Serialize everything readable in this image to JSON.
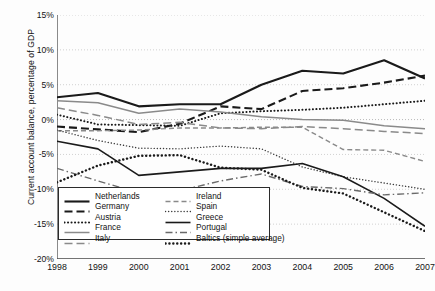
{
  "chart_data": {
    "type": "line",
    "title": "",
    "xlabel": "",
    "ylabel": "Current account balance, percentage of GDP",
    "x": [
      1998,
      1999,
      2000,
      2001,
      2002,
      2003,
      2004,
      2005,
      2006,
      2007
    ],
    "xtick_labels": [
      "1998",
      "1999",
      "2000",
      "2001",
      "2002",
      "2003",
      "2004",
      "2005",
      "2006",
      "2007"
    ],
    "ytick_labels": [
      "15%",
      "10%",
      "5%",
      "0%",
      "-5%",
      "-10%",
      "-15%",
      "-20%"
    ],
    "ytick_values": [
      15,
      10,
      5,
      0,
      -5,
      -10,
      -15,
      -20
    ],
    "ylim": [
      -20,
      15
    ],
    "xlim": [
      1998,
      2007
    ],
    "grid": "horizontal-dotted",
    "legend_position": "bottom-left-inside",
    "series": [
      {
        "name": "Netherlands",
        "style": "solid",
        "color": "#1a1a1a",
        "width": 2.1,
        "values": [
          3.2,
          3.8,
          1.9,
          2.2,
          2.2,
          5.0,
          7.0,
          6.6,
          8.5,
          5.9
        ]
      },
      {
        "name": "Germany",
        "style": "dashed",
        "color": "#1a1a1a",
        "width": 2.1,
        "values": [
          -1.0,
          -1.4,
          -1.8,
          -0.6,
          1.9,
          1.5,
          4.1,
          4.5,
          5.3,
          6.3
        ]
      },
      {
        "name": "Austria",
        "style": "dotted",
        "color": "#1a1a1a",
        "width": 2.0,
        "values": [
          0.7,
          -0.7,
          -0.8,
          -0.9,
          0.9,
          1.2,
          1.4,
          1.7,
          2.2,
          2.7
        ]
      },
      {
        "name": "France",
        "style": "solid",
        "color": "#8a8a8a",
        "width": 1.5,
        "values": [
          2.7,
          2.4,
          0.9,
          1.5,
          1.1,
          0.4,
          0.0,
          -0.1,
          -0.9,
          -1.3
        ]
      },
      {
        "name": "Italy",
        "style": "dashed",
        "color": "#8a8a8a",
        "width": 1.5,
        "values": [
          1.7,
          0.6,
          -0.7,
          -0.4,
          -1.2,
          -1.3,
          -1.0,
          -1.3,
          -1.7,
          -2.0
        ]
      },
      {
        "name": "Ireland",
        "style": "dashed-fine",
        "color": "#8a8a8a",
        "width": 1.4,
        "values": [
          -1.6,
          -1.6,
          -1.5,
          -1.2,
          -1.2,
          -1.1,
          -1.1,
          -4.3,
          -4.4,
          -6.0
        ]
      },
      {
        "name": "Spain",
        "style": "dotted-fine",
        "color": "#3a3a3a",
        "width": 1.4,
        "values": [
          -1.5,
          -3.0,
          -4.1,
          -4.2,
          -3.8,
          -4.2,
          -6.8,
          -8.2,
          -9.1,
          -10.0
        ]
      },
      {
        "name": "Greece",
        "style": "solid",
        "color": "#1a1a1a",
        "width": 1.6,
        "values": [
          -3.1,
          -4.2,
          -8.0,
          -7.5,
          -7.0,
          -7.0,
          -6.3,
          -8.2,
          -11.3,
          -15.3
        ]
      },
      {
        "name": "Portugal",
        "style": "dash-dot",
        "color": "#6a6a6a",
        "width": 1.4,
        "values": [
          -7.0,
          -8.8,
          -10.5,
          -10.2,
          -8.8,
          -7.8,
          -9.6,
          -9.9,
          -10.8,
          -10.5
        ]
      },
      {
        "name": "Baltics (simple average)",
        "style": "dotted-bold",
        "color": "#1a1a1a",
        "width": 2.4,
        "values": [
          -9.0,
          -6.6,
          -5.2,
          -5.1,
          -6.9,
          -7.2,
          -9.8,
          -10.6,
          -13.3,
          -16.0
        ]
      }
    ]
  },
  "legend": {
    "left_column": [
      {
        "label": "Netherlands",
        "style": "solid",
        "color": "#1a1a1a",
        "width": 2.1
      },
      {
        "label": "Germany",
        "style": "dashed",
        "color": "#1a1a1a",
        "width": 2.1
      },
      {
        "label": "Austria",
        "style": "dotted",
        "color": "#1a1a1a",
        "width": 2.0
      },
      {
        "label": "France",
        "style": "solid",
        "color": "#8a8a8a",
        "width": 1.5
      },
      {
        "label": "Italy",
        "style": "dashed",
        "color": "#8a8a8a",
        "width": 1.5
      }
    ],
    "right_column": [
      {
        "label": "Ireland",
        "style": "dashed-fine",
        "color": "#8a8a8a",
        "width": 1.4
      },
      {
        "label": "Spain",
        "style": "dotted-fine",
        "color": "#3a3a3a",
        "width": 1.4
      },
      {
        "label": "Greece",
        "style": "solid",
        "color": "#1a1a1a",
        "width": 1.6
      },
      {
        "label": "Portugal",
        "style": "dash-dot",
        "color": "#6a6a6a",
        "width": 1.4
      },
      {
        "label": "Baltics (simple average)",
        "style": "dotted-bold",
        "color": "#1a1a1a",
        "width": 2.4
      }
    ]
  },
  "axis": {
    "y_title": "Current account balance, percentage of GDP"
  },
  "colors": {
    "axis_line": "#4d4d4d",
    "grid": "#bdbdbd",
    "text": "#131313",
    "background": "#fdfdfd"
  }
}
